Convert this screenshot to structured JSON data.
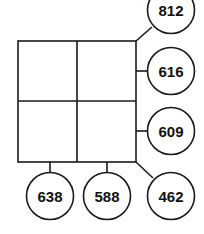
{
  "diagram": {
    "type": "2x2 grid with sum circles",
    "grid": {
      "rows": 2,
      "cols": 2,
      "cells": [
        [
          "",
          ""
        ],
        [
          "",
          ""
        ]
      ]
    },
    "circles": {
      "diagonal_top": "812",
      "row_1": "616",
      "row_2": "609",
      "col_1": "638",
      "col_2": "588",
      "diagonal_bottom": "462"
    },
    "colors": {
      "line": "#1a1a1a",
      "background": "#ffffff"
    }
  }
}
